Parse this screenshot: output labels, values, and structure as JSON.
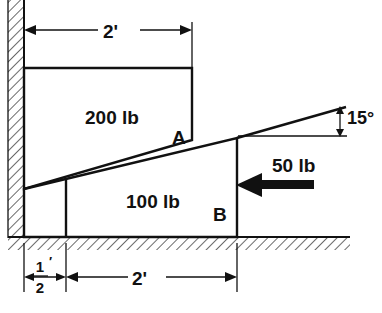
{
  "figure": {
    "ink_color": "#111111",
    "background_color": "#ffffff"
  },
  "labels": {
    "block_upper_weight": "200 lb",
    "block_lower_weight": "100 lb",
    "applied_force": "50 lb",
    "point_a": "A",
    "point_b": "B",
    "angle": "15°",
    "dim_top": "2'",
    "dim_bottom_right": "2'",
    "dim_bottom_left_numerator": "1",
    "dim_bottom_left_denominator": "2",
    "dim_bottom_left_prime": "′"
  },
  "geometry": {
    "wall": {
      "x_outer": 8,
      "x_face": 24,
      "y_top": 0,
      "y_bottom": 237
    },
    "ground": {
      "y": 237,
      "x_start": 8,
      "x_end": 350
    },
    "upper_block": {
      "x_left": 24,
      "x_right": 192,
      "y_top": 68,
      "y_bottom_at_right": 140
    },
    "wedge": {
      "apex_left_x": 24,
      "apex_left_y": 189,
      "apex_right_x": 237,
      "apex_right_y": 138,
      "base_y": 237,
      "inner_divider_x": 66
    },
    "angle_reference": {
      "x_start": 240,
      "x_end": 345,
      "y": 136
    },
    "angle_arrow": {
      "x": 340,
      "y_top": 107,
      "y_bottom": 136
    },
    "force_arrow": {
      "x_tip": 237,
      "x_tail": 313,
      "y": 185
    },
    "dim_top_line": {
      "x_start": 24,
      "x_end": 192,
      "y": 30
    },
    "dim_bottom_line": {
      "y": 277,
      "x_wall": 24,
      "x_divider": 66,
      "x_right": 237
    }
  },
  "values": {
    "upper_weight_lb": 200,
    "lower_weight_lb": 100,
    "applied_force_lb": 50,
    "incline_angle_deg": 15,
    "dim_top_ft": 2,
    "dim_bottom_right_ft": 2,
    "dim_bottom_left_ft": 0.5
  }
}
